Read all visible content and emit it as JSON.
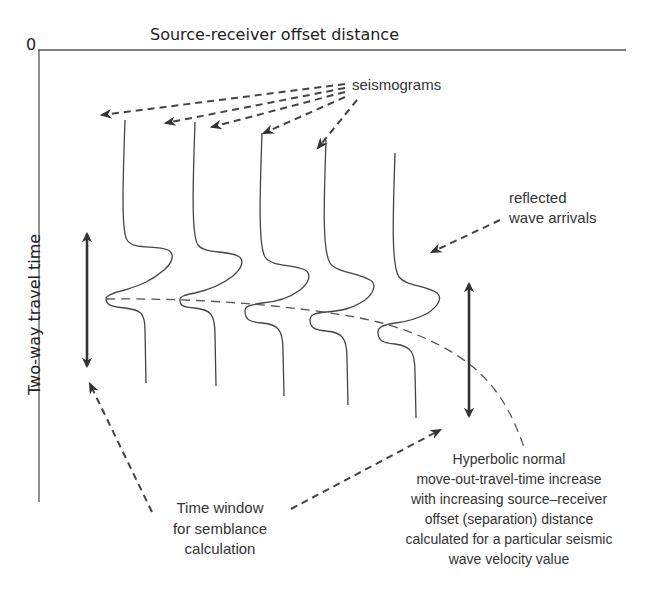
{
  "axes": {
    "origin_label": "0",
    "x_title": "Source-receiver offset distance",
    "y_title": "Two-way travel time"
  },
  "labels": {
    "seismograms": "seismograms",
    "reflected": [
      "reflected",
      "wave arrivals"
    ],
    "time_window": [
      "Time window",
      "for semblance",
      "calculation"
    ],
    "hyperbolic": [
      "Hyperbolic normal",
      "move-out-travel-time increase",
      "with increasing source–receiver",
      "offset (separation) distance",
      "calculated for a particular seismic",
      "wave velocity value"
    ]
  },
  "seismogram_count": 5,
  "colors": {
    "line": "#444444",
    "background": "#ffffff"
  }
}
